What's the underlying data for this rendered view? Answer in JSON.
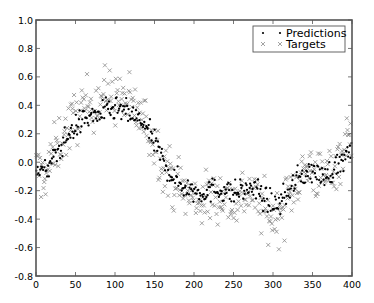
{
  "chart_data": {
    "type": "scatter",
    "title": "",
    "xlabel": "",
    "ylabel": "",
    "xlim": [
      0,
      400
    ],
    "ylim": [
      -0.8,
      1.0
    ],
    "grid": false,
    "legend_position": "upper right",
    "x_ticks": [
      0,
      50,
      100,
      150,
      200,
      250,
      300,
      350,
      400
    ],
    "y_ticks": [
      -0.8,
      -0.6,
      -0.4,
      -0.2,
      0.0,
      0.2,
      0.4,
      0.6,
      0.8,
      1.0
    ],
    "x_tick_labels": [
      "0",
      "50",
      "100",
      "150",
      "200",
      "250",
      "300",
      "350",
      "400"
    ],
    "y_tick_labels": [
      "-0.8",
      "-0.6",
      "-0.4",
      "-0.2",
      "0.0",
      "0.2",
      "0.4",
      "0.6",
      "0.8",
      "1.0"
    ],
    "series": [
      {
        "name": "Predictions",
        "marker": "dot",
        "color": "#000000",
        "trend_x": [
          0,
          10,
          20,
          30,
          40,
          50,
          60,
          70,
          80,
          90,
          100,
          110,
          120,
          130,
          140,
          150,
          160,
          170,
          180,
          190,
          200,
          210,
          220,
          230,
          240,
          250,
          260,
          270,
          280,
          290,
          300,
          310,
          320,
          330,
          340,
          350,
          360,
          370,
          380,
          390,
          400
        ],
        "trend_y": [
          -0.02,
          -0.08,
          0.0,
          0.1,
          0.18,
          0.25,
          0.3,
          0.32,
          0.34,
          0.36,
          0.37,
          0.36,
          0.33,
          0.3,
          0.24,
          0.14,
          0.02,
          -0.08,
          -0.14,
          -0.18,
          -0.2,
          -0.21,
          -0.2,
          -0.19,
          -0.2,
          -0.22,
          -0.2,
          -0.18,
          -0.2,
          -0.26,
          -0.3,
          -0.28,
          -0.2,
          -0.12,
          -0.08,
          -0.06,
          -0.1,
          -0.08,
          -0.03,
          0.02,
          0.08
        ],
        "noise": 0.07
      },
      {
        "name": "Targets",
        "marker": "x",
        "color": "#888888",
        "trend_x": [
          0,
          10,
          20,
          30,
          40,
          50,
          60,
          70,
          80,
          90,
          100,
          110,
          120,
          130,
          140,
          150,
          160,
          170,
          180,
          190,
          200,
          210,
          220,
          230,
          240,
          250,
          260,
          270,
          280,
          290,
          300,
          310,
          320,
          330,
          340,
          350,
          360,
          370,
          380,
          390,
          400
        ],
        "trend_y": [
          -0.05,
          -0.1,
          0.02,
          0.15,
          0.22,
          0.32,
          0.38,
          0.42,
          0.45,
          0.48,
          0.46,
          0.44,
          0.4,
          0.34,
          0.26,
          0.14,
          0.02,
          -0.1,
          -0.16,
          -0.22,
          -0.26,
          -0.27,
          -0.25,
          -0.22,
          -0.24,
          -0.28,
          -0.24,
          -0.2,
          -0.26,
          -0.36,
          -0.4,
          -0.36,
          -0.24,
          -0.12,
          -0.06,
          -0.04,
          -0.12,
          -0.08,
          0.0,
          0.1,
          0.2
        ],
        "noise": 0.16
      }
    ],
    "points_per_series": 400
  },
  "legend": {
    "items": [
      {
        "label": "Predictions",
        "marker": "dot"
      },
      {
        "label": "Targets",
        "marker": "x"
      }
    ]
  }
}
